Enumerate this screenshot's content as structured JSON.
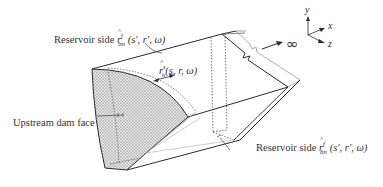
{
  "labels": {
    "reservoir_side_top": {
      "text": "Reservoir side",
      "symbol": "r",
      "sub": "bn",
      "sup": "f",
      "args": "(s′, r′, ω)"
    },
    "dam_traction": {
      "symbol": "r",
      "sub": "n",
      "sup": "s",
      "args": "(s, r, ω)"
    },
    "upstream_face": "Upstream dam face",
    "reservoir_side_bottom": {
      "text": "Reservoir side",
      "symbol": "r",
      "sub": "bn",
      "sup": "f",
      "args": "(s′, r′, ω)"
    },
    "infinity": "∞"
  },
  "axes": {
    "y": "y",
    "x": "x",
    "z": "z"
  },
  "colors": {
    "line": "#2a2a2a",
    "dotted": "#555555",
    "hatch_fill": "#bdbdbd"
  }
}
